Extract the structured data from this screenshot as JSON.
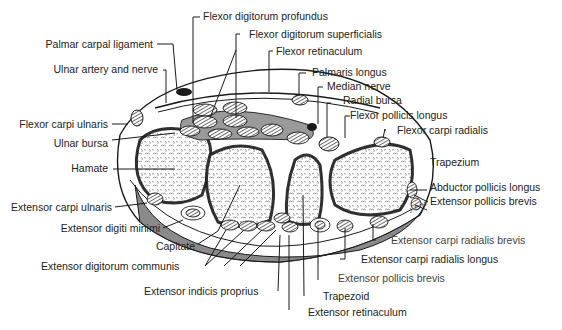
{
  "diagram": {
    "colors": {
      "line": "#1a1a1a",
      "shade": "#8a8a8a",
      "bone": "#ffffff",
      "background": "#ffffff"
    },
    "labels": {
      "flexor_digitorum_profundus": "Flexor digitorum profundus",
      "palmar_carpal_ligament": "Palmar carpal ligament",
      "flexor_digitorum_superficialis": "Flexor digitorum superficialis",
      "flexor_retinaculum": "Flexor retinaculum",
      "ulnar_artery_and_nerve": "Ulnar artery and nerve",
      "palmaris_longus": "Palmaris longus",
      "median_nerve": "Median nerve",
      "radial_bursa": "Radial bursa",
      "flexor_carpi_ulnaris": "Flexor carpi ulnaris",
      "flexor_pollicis_longus": "Flexor pollicis longus",
      "flexor_carpi_radialis": "Flexor carpi radialis",
      "ulnar_bursa": "Ulnar bursa",
      "hamate": "Hamate",
      "trapezium": "Trapezium",
      "abductor_pollicis_longus": "Abductor pollicis longus",
      "extensor_pollicis_brevis_right": "Extensor pollicis brevis",
      "extensor_carpi_ulnaris": "Extensor carpi ulnaris",
      "extensor_digiti_minimi": "Extensor digiti minimi",
      "capitate": "Capitate",
      "extensor_digitorum_communis": "Extensor digitorum communis",
      "extensor_indicis_proprius": "Extensor indicis proprius",
      "extensor_carpi_radialis_brevis": "Extensor carpi radialis brevis",
      "extensor_carpi_radialis_longus": "Extensor carpi radialis longus",
      "extensor_pollicis_brevis_bottom": "Extensor pollicis brevis",
      "trapezoid": "Trapezoid",
      "extensor_retinaculum": "Extensor retinaculum"
    }
  }
}
